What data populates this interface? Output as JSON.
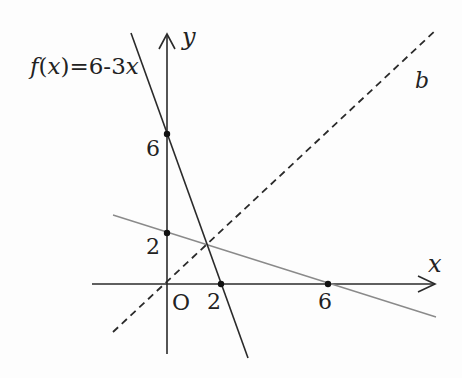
{
  "diagram": {
    "function_label": "f(x)=6-3x",
    "function_label_parts": {
      "f": "f",
      "open": "(",
      "x": "x",
      "close": ")=6-3",
      "x2": "x"
    },
    "axis_x_label": "x",
    "axis_y_label": "y",
    "origin_label": "O",
    "line_b_label": "b",
    "tick_labels": {
      "y6": "6",
      "y2": "2",
      "x2": "2",
      "x6": "6"
    },
    "colors": {
      "axis": "#2a2a2a",
      "function_line": "#2a2a2a",
      "gray_line": "#8a8a8a",
      "dashed_line": "#2a2a2a",
      "point": "#111111"
    },
    "points": [
      {
        "name": "y-intercept-f",
        "x": 0,
        "y": 6
      },
      {
        "name": "x-intercept-f",
        "x": 2,
        "y": 0
      },
      {
        "name": "y-intercept-gray",
        "x": 0,
        "y": 2
      },
      {
        "name": "x-intercept-gray",
        "x": 6,
        "y": 0
      }
    ],
    "lines": [
      {
        "name": "f",
        "equation": "y = 6 - 3x",
        "style": "solid"
      },
      {
        "name": "gray",
        "equation": "y = 2 - x/3",
        "style": "solid-gray"
      },
      {
        "name": "b",
        "equation": "y = x",
        "style": "dashed"
      }
    ]
  }
}
